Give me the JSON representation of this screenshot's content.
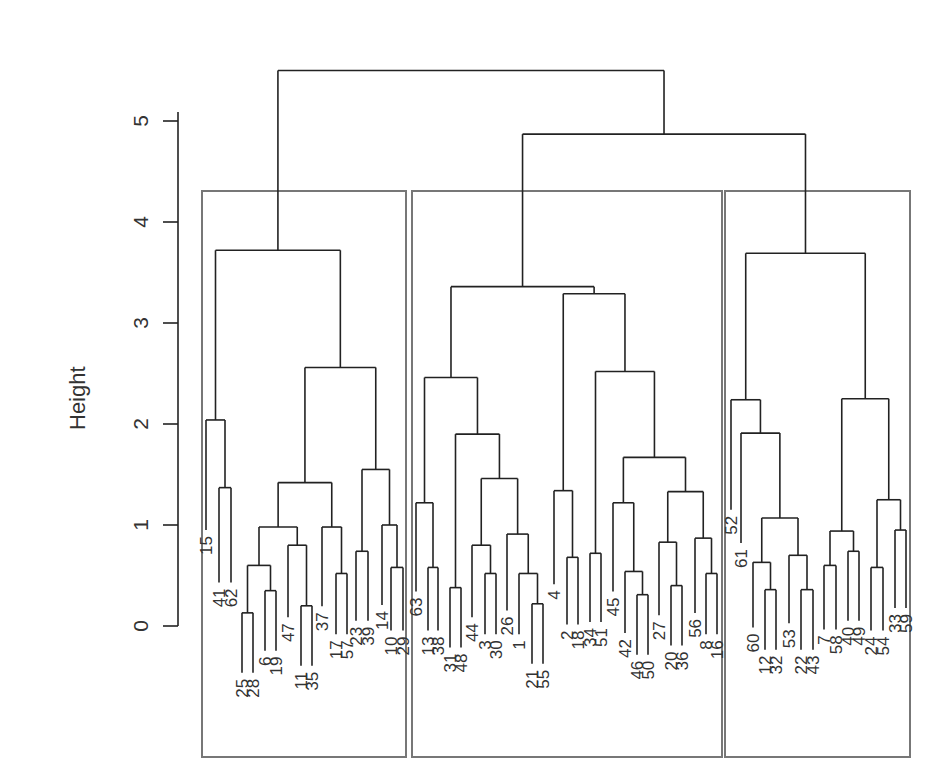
{
  "chart_data": {
    "type": "dendrogram",
    "title": "",
    "xlabel": "",
    "ylabel": "Height",
    "ylim": [
      0,
      5.5
    ],
    "yticks": [
      0,
      1,
      2,
      3,
      4,
      5
    ],
    "grid": false,
    "line_color": "#222222",
    "box_color": "#777777",
    "clusters": [
      {
        "name": "cluster-1",
        "leaves": [
          "15",
          "41",
          "62",
          "25",
          "28",
          "6",
          "19",
          "47",
          "11",
          "35",
          "37",
          "17",
          "57",
          "23",
          "39",
          "14",
          "10",
          "29"
        ]
      },
      {
        "name": "cluster-2",
        "leaves": [
          "63",
          "13",
          "38",
          "31",
          "48",
          "44",
          "3",
          "30",
          "26",
          "1",
          "21",
          "55",
          "4",
          "2",
          "18",
          "34",
          "51",
          "45",
          "42",
          "46",
          "50",
          "27",
          "20",
          "36",
          "56",
          "8",
          "16"
        ]
      },
      {
        "name": "cluster-3",
        "leaves": [
          "52",
          "61",
          "60",
          "12",
          "32",
          "53",
          "22",
          "43",
          "7",
          "58",
          "40",
          "49",
          "24",
          "54",
          "33",
          "59"
        ]
      }
    ],
    "tree": {
      "h": 5.5,
      "c": [
        {
          "h": 3.72,
          "c": [
            {
              "h": 2.04,
              "c": [
                {
                  "l": "15",
                  "x": 206
                },
                {
                  "h": 1.37,
                  "c": [
                    {
                      "l": "41",
                      "x": 219
                    },
                    {
                      "l": "62",
                      "x": 231
                    }
                  ]
                }
              ]
            },
            {
              "h": 2.56,
              "c": [
                {
                  "h": 1.42,
                  "c": [
                    {
                      "h": 0.98,
                      "c": [
                        {
                          "h": 0.6,
                          "c": [
                            {
                              "h": 0.13,
                              "c": [
                                {
                                  "l": "25",
                                  "x": 242
                                },
                                {
                                  "l": "28",
                                  "x": 253
                                }
                              ]
                            },
                            {
                              "h": 0.35,
                              "c": [
                                {
                                  "l": "6",
                                  "x": 265
                                },
                                {
                                  "l": "19",
                                  "x": 276
                                }
                              ]
                            }
                          ]
                        },
                        {
                          "h": 0.8,
                          "c": [
                            {
                              "l": "47",
                              "x": 288
                            },
                            {
                              "h": 0.2,
                              "c": [
                                {
                                  "l": "11",
                                  "x": 301
                                },
                                {
                                  "l": "35",
                                  "x": 312
                                }
                              ]
                            }
                          ]
                        }
                      ]
                    },
                    {
                      "h": 0.98,
                      "c": [
                        {
                          "l": "37",
                          "x": 322
                        },
                        {
                          "h": 0.52,
                          "c": [
                            {
                              "l": "17",
                              "x": 336
                            },
                            {
                              "l": "57",
                              "x": 347
                            }
                          ]
                        }
                      ]
                    }
                  ]
                },
                {
                  "h": 1.55,
                  "c": [
                    {
                      "h": 0.74,
                      "c": [
                        {
                          "l": "23",
                          "x": 356
                        },
                        {
                          "l": "39",
                          "x": 368
                        }
                      ]
                    },
                    {
                      "h": 1.0,
                      "c": [
                        {
                          "l": "14",
                          "x": 382
                        },
                        {
                          "h": 0.58,
                          "c": [
                            {
                              "l": "10",
                              "x": 391
                            },
                            {
                              "l": "29",
                              "x": 403
                            }
                          ]
                        }
                      ]
                    }
                  ]
                }
              ]
            }
          ]
        },
        {
          "h": 4.87,
          "c": [
            {
              "h": 3.36,
              "c": [
                {
                  "h": 2.46,
                  "c": [
                    {
                      "h": 1.22,
                      "c": [
                        {
                          "l": "63",
                          "x": 416
                        },
                        {
                          "h": 0.58,
                          "c": [
                            {
                              "l": "13",
                              "x": 428
                            },
                            {
                              "l": "38",
                              "x": 438
                            }
                          ]
                        }
                      ]
                    },
                    {
                      "h": 1.9,
                      "c": [
                        {
                          "h": 0.38,
                          "c": [
                            {
                              "l": "31",
                              "x": 450
                            },
                            {
                              "l": "48",
                              "x": 461
                            }
                          ]
                        },
                        {
                          "h": 1.46,
                          "c": [
                            {
                              "h": 0.8,
                              "c": [
                                {
                                  "l": "44",
                                  "x": 472
                                },
                                {
                                  "h": 0.52,
                                  "c": [
                                    {
                                      "l": "3",
                                      "x": 485
                                    },
                                    {
                                      "l": "30",
                                      "x": 496
                                    }
                                  ]
                                }
                              ]
                            },
                            {
                              "h": 0.91,
                              "c": [
                                {
                                  "l": "26",
                                  "x": 507
                                },
                                {
                                  "h": 0.52,
                                  "c": [
                                    {
                                      "l": "1",
                                      "x": 519
                                    },
                                    {
                                      "h": 0.22,
                                      "c": [
                                        {
                                          "l": "21",
                                          "x": 532
                                        },
                                        {
                                          "l": "55",
                                          "x": 543
                                        }
                                      ]
                                    }
                                  ]
                                }
                              ]
                            }
                          ]
                        }
                      ]
                    }
                  ]
                },
                {
                  "h": 3.29,
                  "c": [
                    {
                      "h": 1.34,
                      "c": [
                        {
                          "l": "4",
                          "x": 554
                        },
                        {
                          "h": 0.68,
                          "c": [
                            {
                              "l": "2",
                              "x": 567
                            },
                            {
                              "l": "18",
                              "x": 578
                            }
                          ]
                        }
                      ]
                    },
                    {
                      "h": 2.52,
                      "c": [
                        {
                          "h": 0.72,
                          "c": [
                            {
                              "l": "34",
                              "x": 590
                            },
                            {
                              "l": "51",
                              "x": 601
                            }
                          ]
                        },
                        {
                          "h": 1.67,
                          "c": [
                            {
                              "h": 1.22,
                              "c": [
                                {
                                  "l": "45",
                                  "x": 613
                                },
                                {
                                  "h": 0.54,
                                  "c": [
                                    {
                                      "l": "42",
                                      "x": 625
                                    },
                                    {
                                      "h": 0.31,
                                      "c": [
                                        {
                                          "l": "46",
                                          "x": 637
                                        },
                                        {
                                          "l": "50",
                                          "x": 648
                                        }
                                      ]
                                    }
                                  ]
                                }
                              ]
                            },
                            {
                              "h": 1.33,
                              "c": [
                                {
                                  "h": 0.83,
                                  "c": [
                                    {
                                      "l": "27",
                                      "x": 659
                                    },
                                    {
                                      "h": 0.4,
                                      "c": [
                                        {
                                          "l": "20",
                                          "x": 671
                                        },
                                        {
                                          "l": "36",
                                          "x": 682
                                        }
                                      ]
                                    }
                                  ]
                                },
                                {
                                  "h": 0.87,
                                  "c": [
                                    {
                                      "l": "56",
                                      "x": 695
                                    },
                                    {
                                      "h": 0.52,
                                      "c": [
                                        {
                                          "l": "8",
                                          "x": 706
                                        },
                                        {
                                          "l": "16",
                                          "x": 717
                                        }
                                      ]
                                    }
                                  ]
                                }
                              ]
                            }
                          ]
                        }
                      ]
                    }
                  ]
                }
              ]
            },
            {
              "h": 3.69,
              "c": [
                {
                  "h": 2.24,
                  "c": [
                    {
                      "l": "52",
                      "x": 731
                    },
                    {
                      "h": 1.91,
                      "c": [
                        {
                          "l": "61",
                          "x": 741
                        },
                        {
                          "h": 1.07,
                          "c": [
                            {
                              "h": 0.63,
                              "c": [
                                {
                                  "l": "60",
                                  "x": 753
                                },
                                {
                                  "h": 0.36,
                                  "c": [
                                    {
                                      "l": "12",
                                      "x": 765
                                    },
                                    {
                                      "l": "32",
                                      "x": 776
                                    }
                                  ]
                                }
                              ]
                            },
                            {
                              "h": 0.7,
                              "c": [
                                {
                                  "l": "53",
                                  "x": 789
                                },
                                {
                                  "h": 0.36,
                                  "c": [
                                    {
                                      "l": "22",
                                      "x": 801
                                    },
                                    {
                                      "l": "43",
                                      "x": 813
                                    }
                                  ]
                                }
                              ]
                            }
                          ]
                        }
                      ]
                    }
                  ]
                },
                {
                  "h": 2.25,
                  "c": [
                    {
                      "h": 0.94,
                      "c": [
                        {
                          "h": 0.6,
                          "c": [
                            {
                              "l": "7",
                              "x": 824
                            },
                            {
                              "l": "58",
                              "x": 836
                            }
                          ]
                        },
                        {
                          "h": 0.74,
                          "c": [
                            {
                              "l": "40",
                              "x": 848
                            },
                            {
                              "l": "49",
                              "x": 859
                            }
                          ]
                        }
                      ]
                    },
                    {
                      "h": 1.25,
                      "c": [
                        {
                          "h": 0.58,
                          "c": [
                            {
                              "l": "24",
                              "x": 871
                            },
                            {
                              "l": "54",
                              "x": 883
                            }
                          ]
                        },
                        {
                          "h": 0.95,
                          "c": [
                            {
                              "l": "33",
                              "x": 895
                            },
                            {
                              "l": "59",
                              "x": 906
                            }
                          ]
                        }
                      ]
                    }
                  ]
                }
              ]
            }
          ]
        }
      ]
    }
  },
  "axis": {
    "ylabel": "Height",
    "tick_labels": [
      "0",
      "1",
      "2",
      "3",
      "4",
      "5"
    ]
  },
  "boxes": [
    {
      "name": "cluster-1",
      "x1": 202,
      "x2": 406
    },
    {
      "name": "cluster-2",
      "x1": 412,
      "x2": 722
    },
    {
      "name": "cluster-3",
      "x1": 725,
      "x2": 910
    }
  ]
}
